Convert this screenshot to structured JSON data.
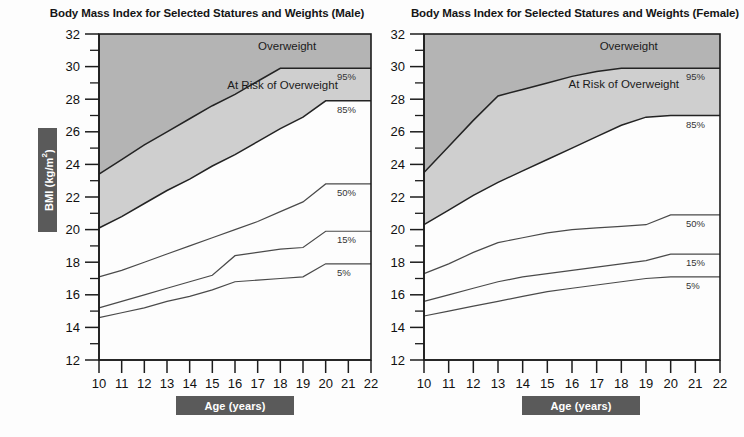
{
  "page": {
    "background": "#fdfdfd",
    "width": 744,
    "height": 437
  },
  "axis_labels": {
    "y_badge_text": "BMI (kg/m",
    "y_badge_sup": "2",
    "y_badge_suffix": ")",
    "x_badge_text": "Age (years)"
  },
  "colors": {
    "overweight_band": "#b4b4b4",
    "at_risk_band": "#cfcfcf",
    "normal_band": "#ffffff",
    "curve": "#232323",
    "badge": "#5a5a5a",
    "badge_text": "#ffffff",
    "axis": "#1c1c1c"
  },
  "zone_labels": {
    "overweight": "Overweight",
    "at_risk": "At Risk of Overweight"
  },
  "percentile_labels": [
    "95%",
    "85%",
    "50%",
    "15%",
    "5%"
  ],
  "chart_data": [
    {
      "type": "line",
      "id": "male",
      "title": "Body Mass Index for Selected Statures and Weights (Male)",
      "xlabel": "Age (years)",
      "ylabel": "BMI (kg/m2)",
      "xlim": [
        10,
        22
      ],
      "ylim": [
        12,
        32
      ],
      "xticks": [
        10,
        11,
        12,
        13,
        14,
        15,
        16,
        17,
        18,
        19,
        20,
        21,
        22
      ],
      "yticks": [
        12,
        14,
        16,
        18,
        20,
        22,
        24,
        26,
        28,
        30,
        32
      ],
      "y_minor_step": 1,
      "grid": false,
      "legend": "inline-right",
      "x": [
        10,
        11,
        12,
        13,
        14,
        15,
        16,
        17,
        18,
        19,
        20,
        21,
        22
      ],
      "series": [
        {
          "name": "95%",
          "label": "95%",
          "values": [
            23.4,
            24.3,
            25.2,
            26.0,
            26.8,
            27.6,
            28.3,
            29.1,
            29.9,
            29.9,
            29.9,
            29.9,
            29.9
          ]
        },
        {
          "name": "85%",
          "label": "85%",
          "values": [
            20.1,
            20.8,
            21.6,
            22.4,
            23.1,
            23.9,
            24.6,
            25.4,
            26.2,
            26.9,
            27.9,
            27.9,
            27.9
          ]
        },
        {
          "name": "50%",
          "label": "50%",
          "values": [
            17.1,
            17.5,
            18.0,
            18.5,
            19.0,
            19.5,
            20.0,
            20.5,
            21.1,
            21.7,
            22.8,
            22.8,
            22.8
          ]
        },
        {
          "name": "15%",
          "label": "15%",
          "values": [
            15.2,
            15.6,
            16.0,
            16.4,
            16.8,
            17.2,
            18.4,
            18.6,
            18.8,
            18.9,
            19.9,
            19.9,
            19.9
          ]
        },
        {
          "name": "5%",
          "label": "5%",
          "values": [
            14.6,
            14.9,
            15.2,
            15.6,
            15.9,
            16.3,
            16.8,
            16.9,
            17.0,
            17.1,
            17.9,
            17.9,
            17.9
          ]
        }
      ],
      "annotations": [
        {
          "text": "Overweight",
          "x": 18.3,
          "y": 31.0
        },
        {
          "text": "At Risk of Overweight",
          "x": 18.1,
          "y": 28.6
        }
      ]
    },
    {
      "type": "line",
      "id": "female",
      "title": "Body Mass Index for Selected Statures and Weights (Female)",
      "xlabel": "Age (years)",
      "ylabel": "BMI (kg/m2)",
      "xlim": [
        10,
        22
      ],
      "ylim": [
        12,
        32
      ],
      "xticks": [
        10,
        11,
        12,
        13,
        14,
        15,
        16,
        17,
        18,
        19,
        20,
        21,
        22
      ],
      "yticks": [
        12,
        14,
        16,
        18,
        20,
        22,
        24,
        26,
        28,
        30,
        32
      ],
      "y_minor_step": 1,
      "grid": false,
      "legend": "inline-right",
      "x": [
        10,
        11,
        12,
        13,
        14,
        15,
        16,
        17,
        18,
        19,
        20,
        21,
        22
      ],
      "series": [
        {
          "name": "95%",
          "label": "95%",
          "values": [
            23.5,
            25.1,
            26.7,
            28.2,
            28.6,
            29.0,
            29.4,
            29.7,
            29.9,
            29.9,
            29.9,
            29.9,
            29.9
          ]
        },
        {
          "name": "85%",
          "label": "85%",
          "values": [
            20.3,
            21.2,
            22.1,
            22.9,
            23.6,
            24.3,
            25.0,
            25.7,
            26.4,
            26.9,
            27.0,
            27.0,
            27.0
          ]
        },
        {
          "name": "50%",
          "label": "50%",
          "values": [
            17.3,
            17.9,
            18.6,
            19.2,
            19.5,
            19.8,
            20.0,
            20.1,
            20.2,
            20.3,
            20.9,
            20.9,
            20.9
          ]
        },
        {
          "name": "15%",
          "label": "15%",
          "values": [
            15.6,
            16.0,
            16.4,
            16.8,
            17.1,
            17.3,
            17.5,
            17.7,
            17.9,
            18.1,
            18.5,
            18.5,
            18.5
          ]
        },
        {
          "name": "5%",
          "label": "5%",
          "values": [
            14.7,
            15.0,
            15.3,
            15.6,
            15.9,
            16.2,
            16.4,
            16.6,
            16.8,
            17.0,
            17.1,
            17.1,
            17.1
          ]
        }
      ],
      "annotations": [
        {
          "text": "Overweight",
          "x": 18.3,
          "y": 31.0
        },
        {
          "text": "At Risk of Overweight",
          "x": 18.1,
          "y": 28.7
        }
      ]
    }
  ]
}
